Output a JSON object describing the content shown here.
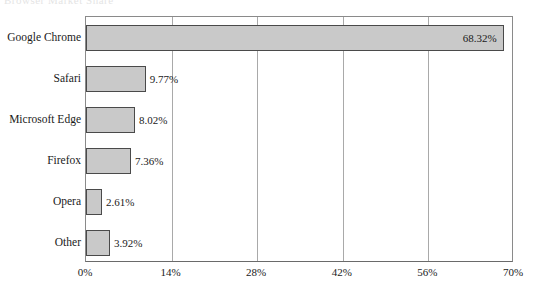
{
  "clipped_title": "Browser Market Share",
  "chart_data": {
    "type": "bar",
    "orientation": "horizontal",
    "title": "",
    "subtitle": "",
    "xlabel": "",
    "ylabel": "",
    "categories": [
      "Google Chrome",
      "Safari",
      "Microsoft Edge",
      "Firefox",
      "Opera",
      "Other"
    ],
    "values": [
      68.32,
      9.77,
      8.02,
      7.36,
      2.61,
      3.92
    ],
    "value_labels": [
      "68.32%",
      "9.77%",
      "8.02%",
      "7.36%",
      "2.61%",
      "3.92%"
    ],
    "xlim": [
      0,
      70
    ],
    "xticks": [
      0,
      14,
      28,
      42,
      56,
      70
    ],
    "xtick_labels": [
      "0%",
      "14%",
      "28%",
      "42%",
      "56%",
      "70%"
    ],
    "grid": true,
    "grid_axis": "x",
    "legend": false,
    "legend_position": "none",
    "bar_fill_color": "#c9c9c9",
    "bar_edge_color": "#4a4a4a",
    "gridline_color": "#a9a9a9",
    "axis_color": "#6a6a6a",
    "background_color": "#ffffff",
    "text_color": "#1a1a1a"
  }
}
